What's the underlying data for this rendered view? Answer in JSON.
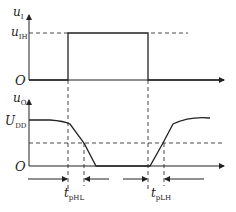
{
  "diagram": {
    "title": "",
    "input_panel": {
      "y_axis_label": "u",
      "y_axis_sub": "I",
      "level_label": "u",
      "level_sub": "IH",
      "origin_label": "O"
    },
    "output_panel": {
      "y_axis_label": "u",
      "y_axis_sub": "O",
      "level_label": "U",
      "level_sub": "DD",
      "origin_label": "O"
    },
    "delays": {
      "fall": {
        "label": "t",
        "sub": "pHL"
      },
      "rise": {
        "label": "t",
        "sub": "pLH"
      }
    }
  },
  "colors": {
    "line": "#222222",
    "background": "#ffffff"
  }
}
